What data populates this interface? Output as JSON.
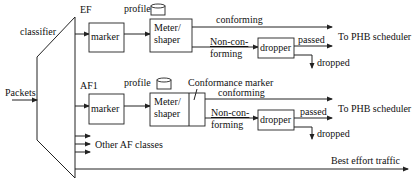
{
  "diagram": {
    "type": "diffserv-traffic-conditioner",
    "classifier": {
      "label": "classifier"
    },
    "input": {
      "label": "Packets"
    },
    "ef": {
      "class_label": "EF",
      "marker_label": "marker",
      "profile_label": "profile",
      "meter_label_line1": "Meter/",
      "meter_label_line2": "shaper",
      "conforming_label": "conforming",
      "nonconf_line1": "Non-con-",
      "nonconf_line2": "forming",
      "dropper_label": "dropper",
      "passed_label": "passed",
      "dropped_label": "dropped",
      "output_label": "To PHB scheduler"
    },
    "af1": {
      "class_label": "AF1",
      "marker_label": "marker",
      "profile_label": "profile",
      "meter_label_line1": "Meter/",
      "meter_label_line2": "shaper",
      "conformance_marker_label": "Conformance marker",
      "conforming_label": "conforming",
      "nonconf_line1": "Non-con-",
      "nonconf_line2": "forming",
      "dropper_label": "dropper",
      "passed_label": "passed",
      "dropped_label": "dropped",
      "output_label": "To PHB scheduler"
    },
    "other_classes_label": "Other AF classes",
    "best_effort_label": "Best effort traffic",
    "colors": {
      "stroke": "#222222",
      "text": "#111111",
      "background": "#ffffff"
    }
  }
}
